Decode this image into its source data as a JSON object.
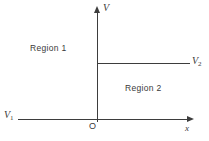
{
  "diagram": {
    "type": "step-potential-figure",
    "axes": {
      "vertical_label": "V",
      "horizontal_label": "x",
      "origin_label": "O"
    },
    "regions": {
      "region1_label": "Region 1",
      "region2_label": "Region 2"
    },
    "levels": {
      "v1": {
        "base": "V",
        "sub": "1"
      },
      "v2": {
        "base": "V",
        "sub": "2"
      }
    },
    "colors": {
      "line": "#3d3d3d",
      "text": "#3a3a3a",
      "background": "#ffffff"
    }
  }
}
